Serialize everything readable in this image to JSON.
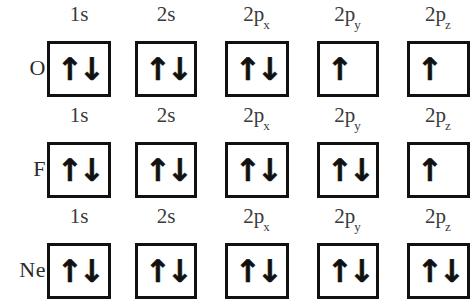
{
  "diagram": {
    "arrow_glyphs": {
      "up": "↑",
      "down": "↓"
    },
    "colors": {
      "box_border": "#111111",
      "arrow": "#111111",
      "text": "#2b2b2b",
      "background": "#ffffff"
    },
    "orbital_labels": [
      {
        "base": "1s",
        "sub": ""
      },
      {
        "base": "2s",
        "sub": ""
      },
      {
        "base": "2p",
        "sub": "x"
      },
      {
        "base": "2p",
        "sub": "y"
      },
      {
        "base": "2p",
        "sub": "z"
      }
    ],
    "rows": [
      {
        "element": "O",
        "labels": [
          {
            "base": "1s",
            "sub": ""
          },
          {
            "base": "2s",
            "sub": ""
          },
          {
            "base": "2p",
            "sub": "x"
          },
          {
            "base": "2p",
            "sub": "y"
          },
          {
            "base": "2p",
            "sub": "z"
          }
        ],
        "boxes": [
          {
            "orbital": "1s",
            "up": "↑",
            "down": "↓",
            "electrons": 2
          },
          {
            "orbital": "2s",
            "up": "↑",
            "down": "↓",
            "electrons": 2
          },
          {
            "orbital": "2px",
            "up": "↑",
            "down": "↓",
            "electrons": 2
          },
          {
            "orbital": "2py",
            "up": "↑",
            "down": "",
            "electrons": 1
          },
          {
            "orbital": "2pz",
            "up": "↑",
            "down": "",
            "electrons": 1
          }
        ]
      },
      {
        "element": "F",
        "labels": [
          {
            "base": "1s",
            "sub": ""
          },
          {
            "base": "2s",
            "sub": ""
          },
          {
            "base": "2p",
            "sub": "x"
          },
          {
            "base": "2p",
            "sub": "y"
          },
          {
            "base": "2p",
            "sub": "z"
          }
        ],
        "boxes": [
          {
            "orbital": "1s",
            "up": "↑",
            "down": "↓",
            "electrons": 2
          },
          {
            "orbital": "2s",
            "up": "↑",
            "down": "↓",
            "electrons": 2
          },
          {
            "orbital": "2px",
            "up": "↑",
            "down": "↓",
            "electrons": 2
          },
          {
            "orbital": "2py",
            "up": "↑",
            "down": "↓",
            "electrons": 2
          },
          {
            "orbital": "2pz",
            "up": "↑",
            "down": "",
            "electrons": 1
          }
        ]
      },
      {
        "element": "Ne",
        "labels": [
          {
            "base": "1s",
            "sub": ""
          },
          {
            "base": "2s",
            "sub": ""
          },
          {
            "base": "2p",
            "sub": "x"
          },
          {
            "base": "2p",
            "sub": "y"
          },
          {
            "base": "2p",
            "sub": "z"
          }
        ],
        "boxes": [
          {
            "orbital": "1s",
            "up": "↑",
            "down": "↓",
            "electrons": 2
          },
          {
            "orbital": "2s",
            "up": "↑",
            "down": "↓",
            "electrons": 2
          },
          {
            "orbital": "2px",
            "up": "↑",
            "down": "↓",
            "electrons": 2
          },
          {
            "orbital": "2py",
            "up": "↑",
            "down": "↓",
            "electrons": 2
          },
          {
            "orbital": "2pz",
            "up": "↑",
            "down": "↓",
            "electrons": 2
          }
        ]
      }
    ]
  }
}
